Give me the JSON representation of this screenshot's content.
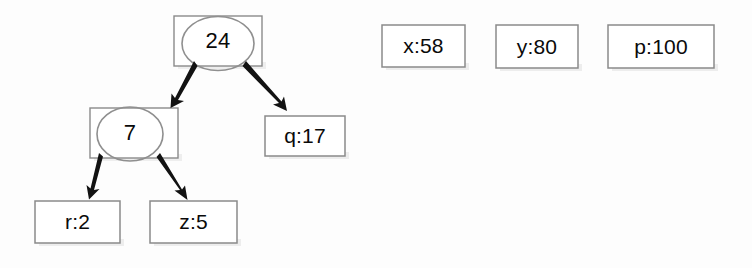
{
  "diagram": {
    "type": "binary-tree-with-variable-boxes",
    "tree_nodes": [
      {
        "id": "root",
        "label": "24",
        "shape": "ellipse-over-rectangle",
        "x": 174,
        "y": 16,
        "w": 88,
        "h": 50
      },
      {
        "id": "left-child",
        "label": "7",
        "shape": "ellipse-over-rectangle",
        "x": 90,
        "y": 108,
        "w": 88,
        "h": 50
      },
      {
        "id": "right-child",
        "label": "q:17",
        "shape": "rectangle",
        "x": 265,
        "y": 116,
        "w": 80,
        "h": 40
      },
      {
        "id": "leaf-left",
        "label": "r:2",
        "shape": "rectangle",
        "x": 35,
        "y": 201,
        "w": 85,
        "h": 42
      },
      {
        "id": "leaf-right",
        "label": "z:5",
        "shape": "rectangle",
        "x": 150,
        "y": 201,
        "w": 87,
        "h": 42
      }
    ],
    "variable_boxes": [
      {
        "id": "var-x",
        "label": "x:58",
        "x": 382,
        "y": 25,
        "w": 83,
        "h": 42
      },
      {
        "id": "var-y",
        "label": "y:80",
        "x": 496,
        "y": 25,
        "w": 82,
        "h": 43
      },
      {
        "id": "var-p",
        "label": "p:100",
        "x": 608,
        "y": 25,
        "w": 106,
        "h": 43
      }
    ],
    "arrows": [
      {
        "id": "arrow-root-to-left",
        "from": "root",
        "to": "left-child",
        "x1": 193,
        "y1": 62,
        "x2": 173,
        "y2": 106
      },
      {
        "id": "arrow-root-to-right",
        "from": "root",
        "to": "right-child",
        "x1": 247,
        "y1": 62,
        "x2": 284,
        "y2": 110
      },
      {
        "id": "arrow-left-to-leafleft",
        "from": "left-child",
        "to": "leaf-left",
        "x1": 98,
        "y1": 155,
        "x2": 90,
        "y2": 197
      },
      {
        "id": "arrow-left-to-leafright",
        "from": "left-child",
        "to": "leaf-right",
        "x1": 161,
        "y1": 155,
        "x2": 186,
        "y2": 198
      }
    ],
    "colors": {
      "background": "#fdfdfd",
      "box_border": "#8a8a8a",
      "ellipse_border": "#8f8f8f",
      "text": "#0a0a0a",
      "arrow": "#111111",
      "shadow": "#d8d8d8"
    }
  }
}
